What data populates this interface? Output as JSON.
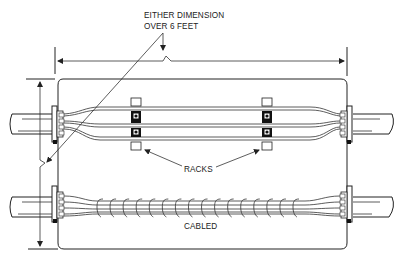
{
  "diagram": {
    "labels": {
      "dimension_note_line1": "EITHER DIMENSION",
      "dimension_note_line2": "OVER 6 FEET",
      "racks": "RACKS",
      "cabled": "CABLED"
    },
    "elements": {
      "enclosure": "rounded rectangle enclosure",
      "horizontal_dimension": "width dimension line with arrows",
      "vertical_dimension": "height dimension line with arrows",
      "racks": [
        {
          "id": "rack-left",
          "position": "left"
        },
        {
          "id": "rack-right",
          "position": "right"
        }
      ],
      "cable_groups": [
        {
          "id": "upper",
          "type": "racked parallel conductors"
        },
        {
          "id": "lower",
          "type": "cabled / laced bundle",
          "lacing_loops": 16
        }
      ],
      "conduits": [
        "upper-left",
        "upper-right",
        "lower-left",
        "lower-right"
      ]
    },
    "colors": {
      "line": "#222222",
      "background": "#ffffff"
    }
  }
}
